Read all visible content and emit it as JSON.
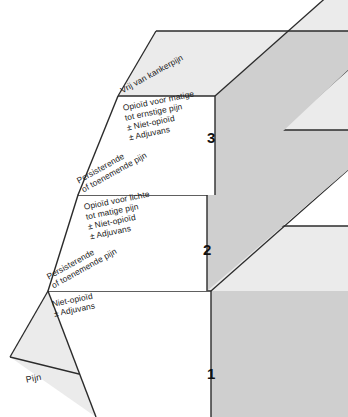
{
  "diagram": {
    "colors": {
      "front_face": "#ffffff",
      "top_face": "#ebebeb",
      "side_face": "#cfcfcf",
      "ground_face": "#ebebeb",
      "outline": "#2b2b2b",
      "text": "#1a1a1a"
    },
    "ground": {
      "label": "Pijn"
    },
    "steps": [
      {
        "number": "1",
        "top_label": "Persisterende\nof toenemende pijn",
        "front_label": "Niet-opioïd\n± Adjuvans"
      },
      {
        "number": "2",
        "top_label": "Persisterende\nof toenemende pijn",
        "front_label": "Opioïd voor lichte\ntot matige pijn\n± Niet-opioïd\n± Adjuvans"
      },
      {
        "number": "3",
        "top_label": "Vrij van kankerpijn",
        "front_label": "Opioïd voor matige\ntot ernstige pijn\n± Niet-opioïd\n± Adjuvans"
      }
    ]
  }
}
